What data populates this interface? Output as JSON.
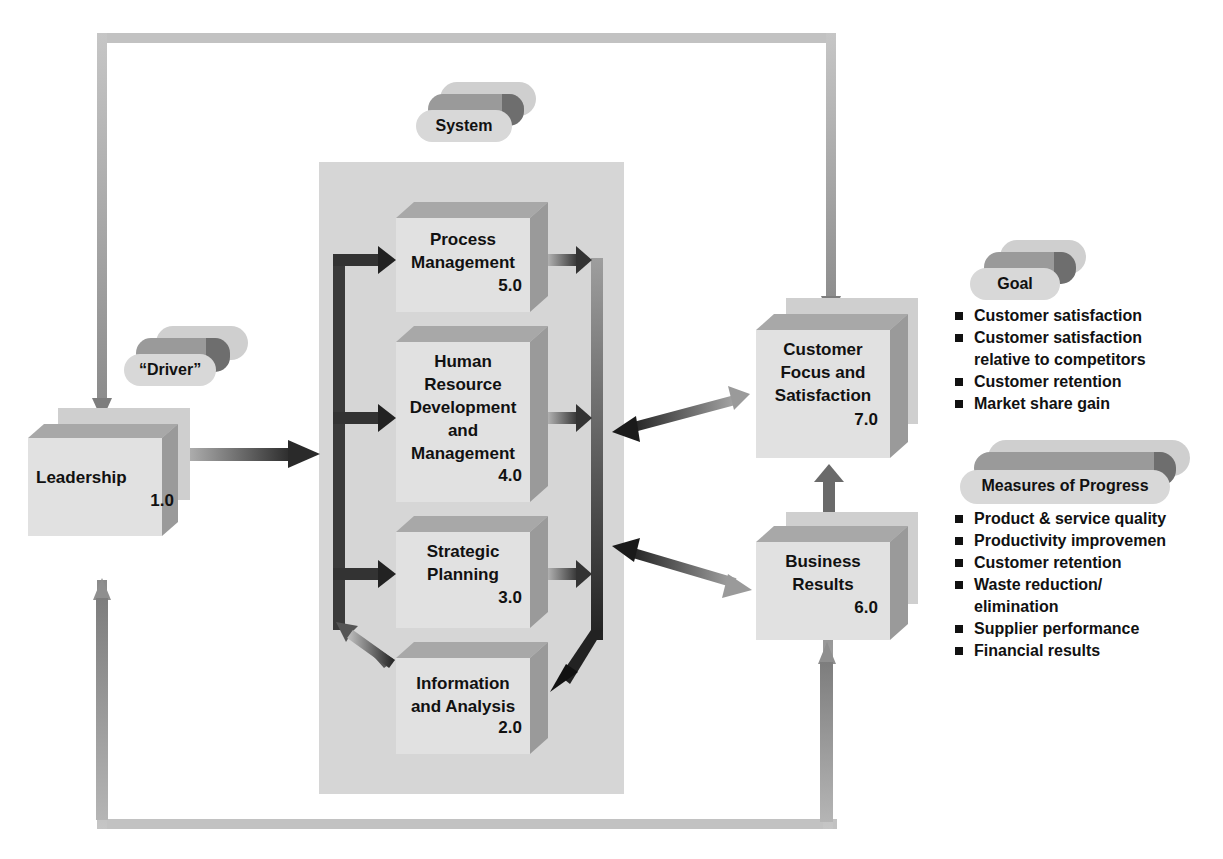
{
  "diagram": {
    "labels": {
      "system": "System",
      "driver": "“Driver”",
      "goal": "Goal",
      "measures": "Measures of Progress"
    },
    "boxes": {
      "leadership": {
        "title": "Leadership",
        "number": "1.0"
      },
      "process": {
        "title_lines": [
          "Process",
          "Management"
        ],
        "number": "5.0"
      },
      "hr": {
        "title_lines": [
          "Human",
          "Resource",
          "Development",
          "and",
          "Management"
        ],
        "number": "4.0"
      },
      "strategic": {
        "title_lines": [
          "Strategic",
          "Planning"
        ],
        "number": "3.0"
      },
      "info": {
        "title_lines": [
          "Information",
          "and Analysis"
        ],
        "number": "2.0"
      },
      "customer": {
        "title_lines": [
          "Customer",
          "Focus and",
          "Satisfaction"
        ],
        "number": "7.0"
      },
      "business": {
        "title_lines": [
          "Business",
          "Results"
        ],
        "number": "6.0"
      }
    },
    "goal_items": [
      "Customer satisfaction",
      "Customer satisfaction relative to competitors",
      "Customer retention",
      "Market share gain"
    ],
    "goal_items_display": {
      "0": "Customer satisfaction",
      "1a": "Customer satisfaction",
      "1b": "relative to competitors",
      "2": "Customer retention",
      "3": "Market share gain"
    },
    "measures_items": [
      "Product & service quality",
      "Productivity improvemen",
      "Customer retention",
      "Waste reduction/ elimination",
      "Supplier performance",
      "Financial results"
    ],
    "measures_items_display": {
      "0": "Product & service quality",
      "1": "Productivity improvemen",
      "2": "Customer retention",
      "3a": "Waste reduction/",
      "3b": "elimination",
      "4": "Supplier performance",
      "5": "Financial results"
    },
    "colors": {
      "frame": "#b9b9b9",
      "system_panel": "#d6d6d6",
      "box_face": "#e1e1e1",
      "arrow_dark": "#2b2b2b",
      "arrow_mid": "#8a8a8a"
    }
  }
}
